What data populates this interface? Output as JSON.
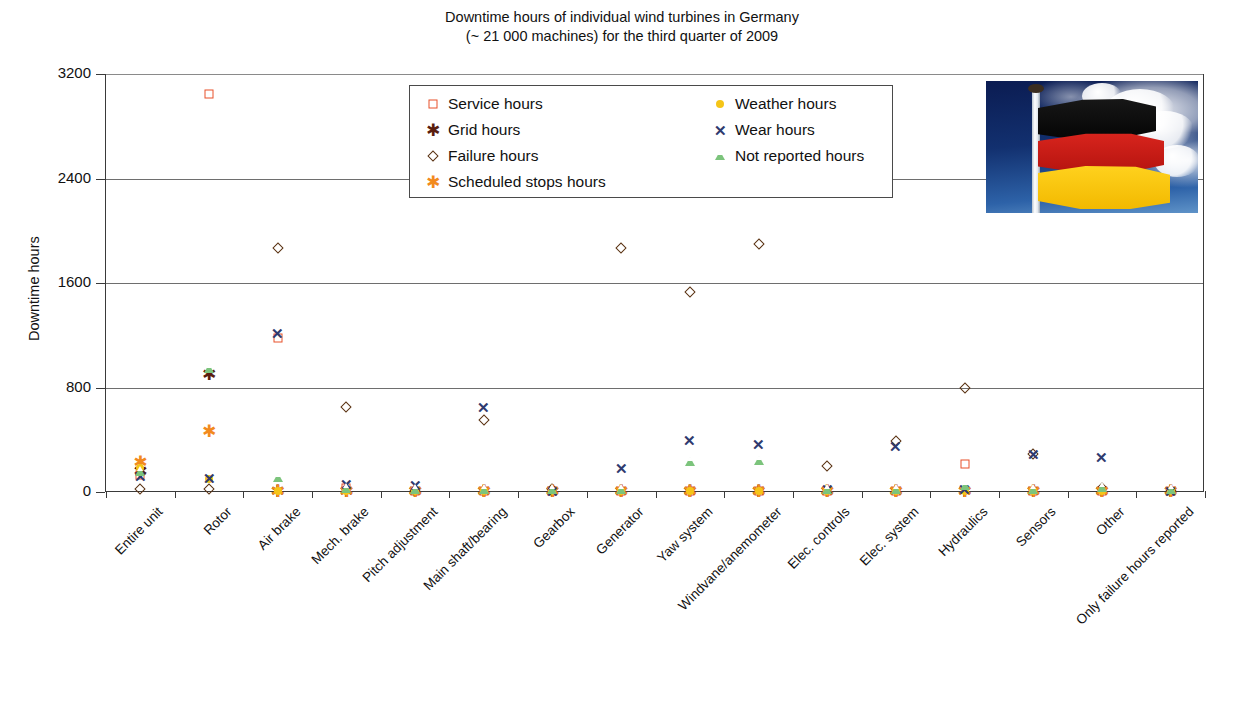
{
  "chart_data": {
    "type": "scatter",
    "title": "Downtime hours of individual wind turbines in Germany (~ 21 000 machines) for the third quarter of 2009",
    "title_line1": "Downtime hours of individual wind turbines in Germany",
    "title_line2": "(~ 21 000 machines) for the third quarter of 2009",
    "xlabel": "",
    "ylabel": "Downtime hours",
    "ylim": [
      0,
      3200
    ],
    "yticks": [
      0,
      800,
      1600,
      2400,
      3200
    ],
    "grid": "horizontal",
    "legend_position": "upper-center",
    "categories": [
      "Entire unit",
      "Rotor",
      "Air brake",
      "Mech. brake",
      "Pitch adjustment",
      "Main shaft/bearing",
      "Gearbox",
      "Generator",
      "Yaw system",
      "Windvane/anemometer",
      "Elec. controls",
      "Elec. system",
      "Hydraulics",
      "Sensors",
      "Other",
      "Only failure hours reported"
    ],
    "series": [
      {
        "name": "Service hours",
        "marker": "square-open",
        "color": "#e8502a",
        "values": [
          130,
          3050,
          1180,
          30,
          10,
          5,
          5,
          5,
          5,
          5,
          5,
          10,
          215,
          5,
          5,
          5
        ]
      },
      {
        "name": "Grid hours",
        "marker": "star6-filled",
        "color": "#5a1e0e",
        "values": [
          160,
          900,
          10,
          5,
          5,
          5,
          5,
          5,
          5,
          5,
          5,
          5,
          5,
          5,
          5,
          5
        ]
      },
      {
        "name": "Failure hours",
        "marker": "diamond-open",
        "color": "#5a3212",
        "values": [
          20,
          20,
          1870,
          650,
          10,
          555,
          20,
          1870,
          1530,
          1900,
          200,
          390,
          800,
          290,
          30,
          10
        ]
      },
      {
        "name": "Scheduled stops hours",
        "marker": "asterisk",
        "color": "#f28a1e",
        "values": [
          230,
          470,
          10,
          10,
          10,
          10,
          10,
          10,
          10,
          10,
          10,
          10,
          10,
          10,
          10,
          10
        ]
      },
      {
        "name": "Weather hours",
        "marker": "circle-filled",
        "color": "#f5c518",
        "values": [
          180,
          100,
          10,
          10,
          10,
          10,
          10,
          10,
          10,
          10,
          10,
          10,
          10,
          10,
          10,
          10
        ]
      },
      {
        "name": "Wear hours",
        "marker": "x",
        "color": "#2e3a6e",
        "values": [
          120,
          110,
          1220,
          60,
          50,
          650,
          10,
          185,
          400,
          365,
          20,
          350,
          20,
          290,
          265,
          10
        ]
      },
      {
        "name": "Not reported hours",
        "marker": "triangle-open",
        "color": "#7cc47c",
        "values": [
          150,
          940,
          110,
          20,
          15,
          15,
          15,
          15,
          230,
          240,
          15,
          15,
          45,
          15,
          30,
          15
        ]
      }
    ]
  },
  "legend": {
    "entries": [
      {
        "label": "Service hours",
        "marker": "square-open",
        "color": "#e8502a"
      },
      {
        "label": "Weather hours",
        "marker": "circle-filled",
        "color": "#f5c518"
      },
      {
        "label": "Grid hours",
        "marker": "star6-filled",
        "color": "#5a1e0e"
      },
      {
        "label": "Wear hours",
        "marker": "x",
        "color": "#2e3a6e"
      },
      {
        "label": "Failure hours",
        "marker": "diamond-open",
        "color": "#5a3212"
      },
      {
        "label": "Not reported hours",
        "marker": "triangle-open",
        "color": "#7cc47c"
      },
      {
        "label": "Scheduled stops hours",
        "marker": "asterisk",
        "color": "#f28a1e"
      }
    ]
  },
  "flag_photo": {
    "caption": "photograph of the German national flag on a flagpole against a blue sky with clouds"
  }
}
